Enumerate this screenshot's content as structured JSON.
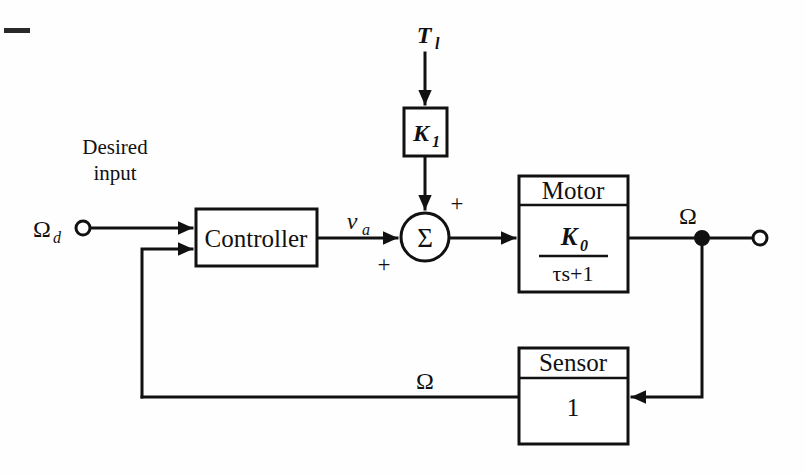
{
  "diagram": {
    "type": "control-system-block-diagram",
    "stroke_color": "#111111",
    "background_color": "#fefefe",
    "labels": {
      "desired_input_line1": "Desired",
      "desired_input_line2": "input",
      "reference_signal": "Ω",
      "reference_signal_sub": "d",
      "disturbance_signal": "T",
      "disturbance_signal_sub": "l",
      "controller_output": "v",
      "controller_output_sub": "a",
      "output_signal": "Ω",
      "feedback_signal": "Ω",
      "sum_symbol": "Σ",
      "plus_top": "+",
      "plus_bottom": "+"
    },
    "blocks": [
      {
        "id": "disturbance-gain",
        "name": "K1",
        "symbol": "K",
        "subscript": "1",
        "header": "",
        "x": 404,
        "y": 108,
        "w": 43,
        "h": 48
      },
      {
        "id": "controller",
        "name": "Controller",
        "header": "",
        "body": "Controller",
        "x": 196,
        "y": 209,
        "w": 121,
        "h": 57
      },
      {
        "id": "motor",
        "name": "Motor",
        "header": "Motor",
        "numerator": "K",
        "numerator_sub": "0",
        "denominator": "τs+1",
        "x": 519,
        "y": 176,
        "w": 109,
        "h": 116,
        "header_h": 29
      },
      {
        "id": "sensor",
        "name": "Sensor",
        "header": "Sensor",
        "body": "1",
        "x": 519,
        "y": 348,
        "w": 109,
        "h": 96,
        "header_h": 30
      }
    ],
    "junctions": [
      {
        "id": "summing-junction",
        "symbol": "Σ",
        "cx": 425,
        "cy": 237,
        "r": 24
      },
      {
        "id": "output-takeoff-node",
        "cx": 702,
        "cy": 238,
        "r": 7,
        "filled": true
      },
      {
        "id": "input-terminal",
        "cx": 83,
        "cy": 228,
        "r": 7,
        "filled": false
      },
      {
        "id": "output-terminal",
        "cx": 760,
        "cy": 238,
        "r": 7,
        "filled": false
      }
    ]
  }
}
